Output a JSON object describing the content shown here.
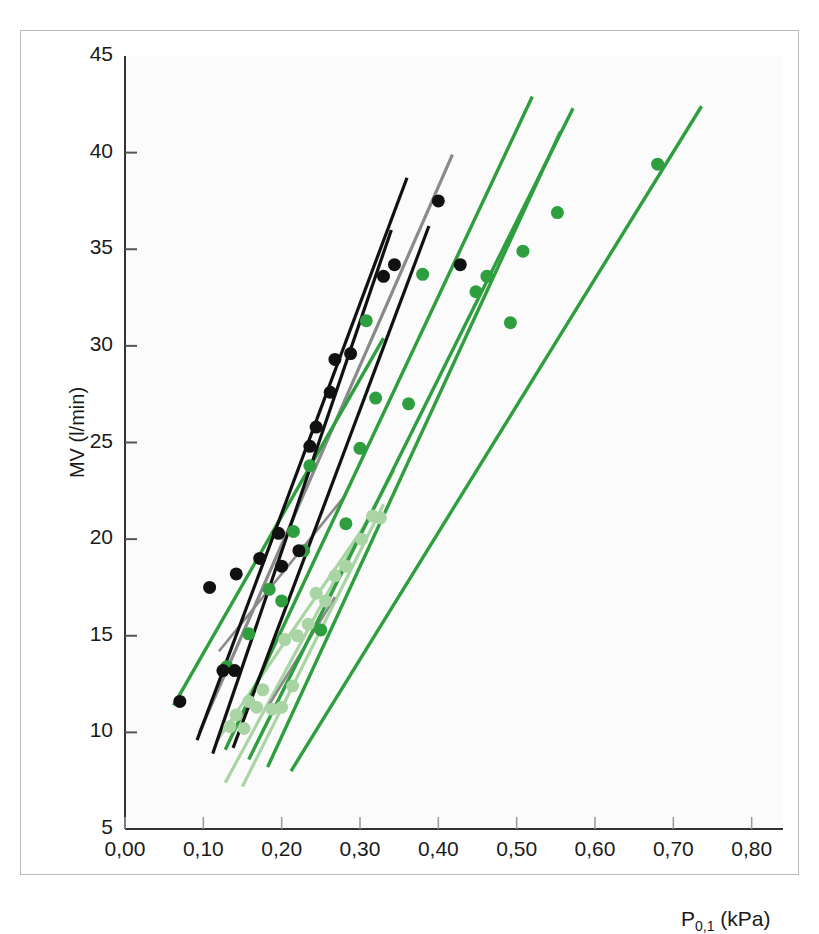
{
  "figure": {
    "background": "#ffffff",
    "frame_color": "#b9b9b9"
  },
  "chart_data": {
    "type": "scatter",
    "title": "",
    "xlabel": "P0,1 (kPa)",
    "xlabel_main": "P",
    "xlabel_sub": "0,1",
    "xlabel_unit": " (kPa)",
    "ylabel": "MV (l/min)",
    "xlim": [
      0.0,
      0.84
    ],
    "ylim": [
      5,
      45
    ],
    "xticks": [
      0.0,
      0.1,
      0.2,
      0.3,
      0.4,
      0.5,
      0.6,
      0.7,
      0.8
    ],
    "xticklabels": [
      "0,00",
      "0,10",
      "0,20",
      "0,30",
      "0,40",
      "0,50",
      "0,60",
      "0,70",
      "0,80"
    ],
    "yticks": [
      5,
      10,
      15,
      20,
      25,
      30,
      35,
      40,
      45
    ],
    "yticklabels": [
      "5",
      "10",
      "15",
      "20",
      "25",
      "30",
      "35",
      "40",
      "45"
    ],
    "grid": false,
    "legend": "none",
    "colors": {
      "black": "#111111",
      "gray": "#8a8a8a",
      "green": "#2e9e3e",
      "light_green": "#a9d5a4"
    },
    "series": [
      {
        "name": "black-points",
        "color": "#111111",
        "marker": "circle",
        "marker_size": 13,
        "points": [
          [
            0.07,
            11.6
          ],
          [
            0.108,
            17.5
          ],
          [
            0.125,
            13.2
          ],
          [
            0.14,
            13.2
          ],
          [
            0.142,
            18.2
          ],
          [
            0.172,
            19.0
          ],
          [
            0.196,
            20.3
          ],
          [
            0.2,
            18.6
          ],
          [
            0.222,
            19.4
          ],
          [
            0.236,
            24.8
          ],
          [
            0.244,
            25.8
          ],
          [
            0.262,
            27.6
          ],
          [
            0.268,
            29.3
          ],
          [
            0.288,
            29.6
          ],
          [
            0.33,
            33.6
          ],
          [
            0.344,
            34.2
          ],
          [
            0.4,
            37.5
          ],
          [
            0.428,
            34.2
          ]
        ]
      },
      {
        "name": "green-points",
        "color": "#2e9e3e",
        "marker": "circle",
        "marker_size": 13,
        "points": [
          [
            0.13,
            13.4
          ],
          [
            0.158,
            15.1
          ],
          [
            0.184,
            17.4
          ],
          [
            0.2,
            16.8
          ],
          [
            0.215,
            20.4
          ],
          [
            0.228,
            19.4
          ],
          [
            0.236,
            23.8
          ],
          [
            0.25,
            15.3
          ],
          [
            0.282,
            20.8
          ],
          [
            0.3,
            24.7
          ],
          [
            0.308,
            31.3
          ],
          [
            0.32,
            27.3
          ],
          [
            0.362,
            27.0
          ],
          [
            0.38,
            33.7
          ],
          [
            0.448,
            32.8
          ],
          [
            0.462,
            33.6
          ],
          [
            0.492,
            31.2
          ],
          [
            0.508,
            34.9
          ],
          [
            0.552,
            36.9
          ],
          [
            0.68,
            39.4
          ]
        ]
      },
      {
        "name": "light-green-points",
        "color": "#a9d5a4",
        "marker": "circle",
        "marker_size": 13,
        "points": [
          [
            0.134,
            10.3
          ],
          [
            0.142,
            10.9
          ],
          [
            0.152,
            10.2
          ],
          [
            0.158,
            11.6
          ],
          [
            0.168,
            11.3
          ],
          [
            0.176,
            12.2
          ],
          [
            0.188,
            11.2
          ],
          [
            0.2,
            11.3
          ],
          [
            0.204,
            14.8
          ],
          [
            0.214,
            12.4
          ],
          [
            0.22,
            15.0
          ],
          [
            0.234,
            15.6
          ],
          [
            0.244,
            17.2
          ],
          [
            0.256,
            16.8
          ],
          [
            0.268,
            18.1
          ],
          [
            0.282,
            18.6
          ],
          [
            0.302,
            20.0
          ],
          [
            0.316,
            21.2
          ],
          [
            0.326,
            21.1
          ]
        ]
      }
    ],
    "regression_lines": [
      {
        "name": "black-line-1",
        "color": "#111111",
        "width": 3.2,
        "x0": 0.092,
        "y0": 9.6,
        "x1": 0.36,
        "y1": 38.7
      },
      {
        "name": "black-line-2",
        "color": "#111111",
        "width": 3.2,
        "x0": 0.112,
        "y0": 8.9,
        "x1": 0.34,
        "y1": 36.0
      },
      {
        "name": "black-line-3",
        "color": "#111111",
        "width": 3.2,
        "x0": 0.138,
        "y0": 9.2,
        "x1": 0.388,
        "y1": 36.2
      },
      {
        "name": "gray-line-1",
        "color": "#8a8a8a",
        "width": 3.2,
        "x0": 0.095,
        "y0": 10.0,
        "x1": 0.418,
        "y1": 39.9
      },
      {
        "name": "gray-line-2",
        "color": "#8a8a8a",
        "width": 2.6,
        "x0": 0.12,
        "y0": 14.2,
        "x1": 0.28,
        "y1": 22.2
      },
      {
        "name": "gray-line-3",
        "color": "#8a8a8a",
        "width": 2.6,
        "x0": 0.182,
        "y0": 11.3,
        "x1": 0.268,
        "y1": 17.0
      },
      {
        "name": "green-line-1",
        "color": "#2e9e3e",
        "width": 3.4,
        "x0": 0.062,
        "y0": 11.4,
        "x1": 0.33,
        "y1": 30.4
      },
      {
        "name": "green-line-2",
        "color": "#2e9e3e",
        "width": 3.4,
        "x0": 0.128,
        "y0": 9.1,
        "x1": 0.52,
        "y1": 42.9
      },
      {
        "name": "green-line-3",
        "color": "#2e9e3e",
        "width": 3.4,
        "x0": 0.158,
        "y0": 8.6,
        "x1": 0.572,
        "y1": 42.3
      },
      {
        "name": "green-line-4",
        "color": "#2e9e3e",
        "width": 3.4,
        "x0": 0.182,
        "y0": 8.2,
        "x1": 0.556,
        "y1": 41.1
      },
      {
        "name": "green-line-5",
        "color": "#2e9e3e",
        "width": 3.4,
        "x0": 0.212,
        "y0": 8.0,
        "x1": 0.736,
        "y1": 42.4
      },
      {
        "name": "light-green-line-1",
        "color": "#a9d5a4",
        "width": 3.2,
        "x0": 0.128,
        "y0": 7.4,
        "x1": 0.344,
        "y1": 23.6
      },
      {
        "name": "light-green-line-2",
        "color": "#a9d5a4",
        "width": 3.2,
        "x0": 0.15,
        "y0": 7.2,
        "x1": 0.33,
        "y1": 21.8
      },
      {
        "name": "light-green-line-3",
        "color": "#a9d5a4",
        "width": 3.2,
        "x0": 0.118,
        "y0": 9.6,
        "x1": 0.318,
        "y1": 21.4
      }
    ]
  }
}
